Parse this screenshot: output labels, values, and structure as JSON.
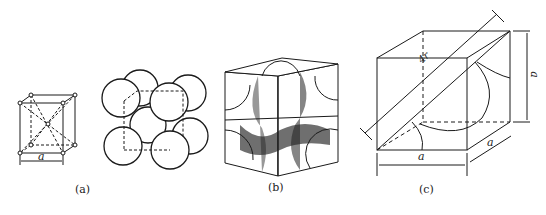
{
  "figure": {
    "panels": [
      {
        "id": "a",
        "caption": "(a)",
        "description": "Body-centered cubic unit cell: lattice-point model and hard-sphere model",
        "dimension_label": "a"
      },
      {
        "id": "b",
        "caption": "(b)",
        "description": "Cut-away unit cell showing atom sections inside the cube"
      },
      {
        "id": "c",
        "caption": "(c)",
        "description": "Cube with body diagonal of length 4r",
        "diagonal_label": "4r",
        "edge_labels": [
          "a",
          "a",
          "a"
        ]
      }
    ],
    "colors": {
      "line": "#1a1a1a",
      "shade": "#333333",
      "background": "#ffffff"
    }
  }
}
